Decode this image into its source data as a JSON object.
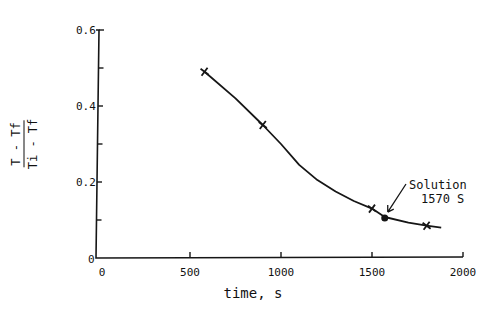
{
  "chart_data": {
    "type": "line",
    "title": "",
    "xlabel": "time, s",
    "ylabel_numerator": "T - Tf",
    "ylabel_denominator": "Ti - Tf",
    "ylabel": "(T - Tf)/(Ti - Tf)",
    "xlim": [
      0,
      2000
    ],
    "ylim": [
      0,
      0.6
    ],
    "x_ticks": [
      0,
      500,
      1000,
      1500,
      2000
    ],
    "x_tick_labels": [
      "0",
      "500",
      "1000",
      "1500",
      "2000"
    ],
    "y_ticks_major": [
      0,
      0.2,
      0.4,
      0.6
    ],
    "y_tick_labels": [
      "0",
      "0.2",
      "0.4",
      "0.6"
    ],
    "y_ticks_minor": [
      0.1,
      0.3,
      0.5
    ],
    "x_origin_label": "0",
    "grid": false,
    "legend": null,
    "series": [
      {
        "name": "Data points",
        "marker": "x",
        "x": [
          580,
          900,
          1500,
          1800
        ],
        "y": [
          0.49,
          0.35,
          0.13,
          0.085
        ]
      },
      {
        "name": "Fitted curve",
        "marker": "none",
        "x": [
          580,
          750,
          900,
          1000,
          1100,
          1200,
          1300,
          1400,
          1500,
          1570,
          1700,
          1800,
          1880
        ],
        "y": [
          0.49,
          0.42,
          0.35,
          0.3,
          0.245,
          0.205,
          0.175,
          0.15,
          0.13,
          0.108,
          0.093,
          0.085,
          0.08
        ]
      },
      {
        "name": "Solution",
        "marker": "dot",
        "x": [
          1570
        ],
        "y": [
          0.105
        ]
      }
    ],
    "annotations": [
      {
        "text_line1": "Solution",
        "text_line2": "1570 S",
        "x": 1570,
        "y": 0.105
      }
    ]
  }
}
